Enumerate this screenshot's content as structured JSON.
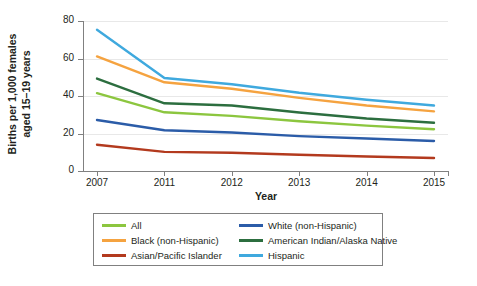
{
  "chart_data": {
    "type": "line",
    "title": "",
    "xlabel": "Year",
    "ylabel_line1": "Births per 1,000 females",
    "ylabel_line2": "aged 15–19 years",
    "categories": [
      "2007",
      "2011",
      "2012",
      "2013",
      "2014",
      "2015"
    ],
    "yticks": [
      0,
      20,
      40,
      60,
      80
    ],
    "ylim": [
      0,
      80
    ],
    "grid": true,
    "legend_position": "bottom",
    "series": [
      {
        "name": "All",
        "color": "#8CC63F",
        "values": [
          41.5,
          31.3,
          29.4,
          26.5,
          24.2,
          22.3
        ]
      },
      {
        "name": "Black (non-Hispanic)",
        "color": "#F5A340",
        "values": [
          61.1,
          47.3,
          43.9,
          39.0,
          34.9,
          31.8
        ]
      },
      {
        "name": "Asian/Pacific Islander",
        "color": "#B33A1E",
        "values": [
          14.0,
          10.2,
          9.7,
          8.7,
          7.7,
          6.9
        ]
      },
      {
        "name": "White (non-Hispanic)",
        "color": "#2B5CA8",
        "values": [
          27.2,
          21.7,
          20.5,
          18.6,
          17.3,
          16.0
        ]
      },
      {
        "name": "American Indian/Alaska Native",
        "color": "#2C6E3F",
        "values": [
          49.3,
          36.1,
          34.9,
          31.2,
          28.0,
          25.7
        ]
      },
      {
        "name": "Hispanic",
        "color": "#3FA9DE",
        "values": [
          75.3,
          49.6,
          46.3,
          41.7,
          38.0,
          34.9
        ]
      }
    ]
  }
}
